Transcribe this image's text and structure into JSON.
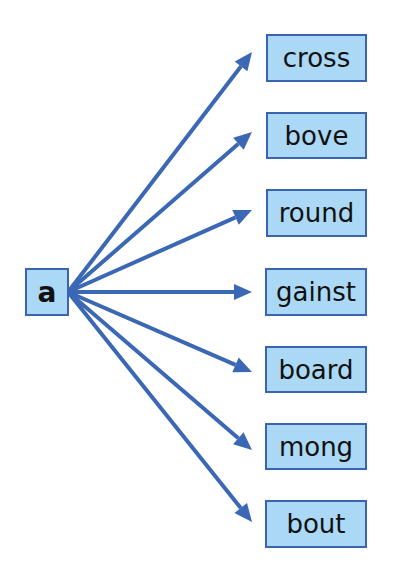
{
  "diagram": {
    "source": {
      "label": "a",
      "x": 25,
      "y": 268,
      "w": 44,
      "h": 48
    },
    "anchor": {
      "x": 68,
      "y": 292
    },
    "tip_x": 252,
    "colors": {
      "arrow": "#3a68b4",
      "box_fill": "#aad8f5",
      "box_border": "#3a64b0",
      "text": "#111111"
    },
    "targets": [
      {
        "label": "cross",
        "x": 266,
        "y": 34,
        "w": 101,
        "h": 48,
        "tip_y": 52
      },
      {
        "label": "bove",
        "x": 266,
        "y": 112,
        "w": 101,
        "h": 47,
        "tip_y": 132
      },
      {
        "label": "round",
        "x": 266,
        "y": 189,
        "w": 101,
        "h": 48,
        "tip_y": 210
      },
      {
        "label": "gainst",
        "x": 265,
        "y": 268,
        "w": 102,
        "h": 48,
        "tip_y": 292
      },
      {
        "label": "board",
        "x": 265,
        "y": 346,
        "w": 102,
        "h": 47,
        "tip_y": 372
      },
      {
        "label": "mong",
        "x": 265,
        "y": 423,
        "w": 102,
        "h": 47,
        "tip_y": 450
      },
      {
        "label": "bout",
        "x": 265,
        "y": 500,
        "w": 102,
        "h": 48,
        "tip_y": 522
      }
    ]
  }
}
